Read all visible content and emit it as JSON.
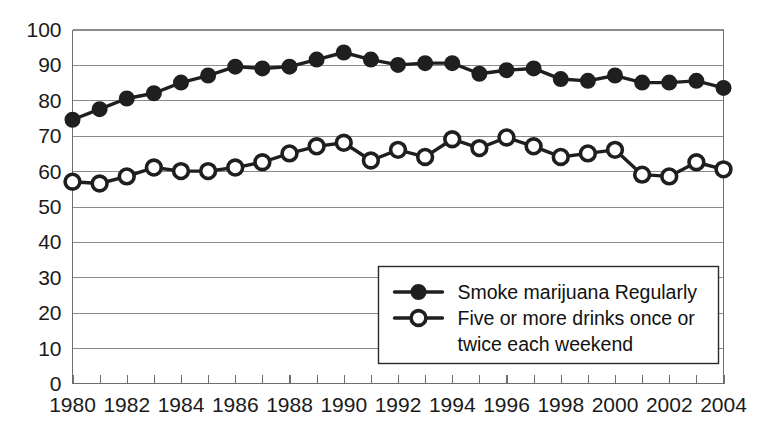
{
  "chart_data": {
    "type": "line",
    "title": "",
    "subtitle": "",
    "xlabel": "",
    "ylabel": "",
    "xlim": [
      1980,
      2004
    ],
    "ylim": [
      0,
      100
    ],
    "y_ticks": [
      0,
      10,
      20,
      30,
      40,
      50,
      60,
      70,
      80,
      90,
      100
    ],
    "x_ticks": [
      1980,
      1982,
      1984,
      1986,
      1988,
      1990,
      1992,
      1994,
      1996,
      1998,
      2000,
      2002,
      2004
    ],
    "x_tick_labels": [
      "1980",
      "1982",
      "1984",
      "1986",
      "1988",
      "1990",
      "1992",
      "1994",
      "1996",
      "1998",
      "2000",
      "2002",
      "2004"
    ],
    "y_tick_labels": [
      "0",
      "10",
      "20",
      "30",
      "40",
      "50",
      "60",
      "70",
      "80",
      "90",
      "100"
    ],
    "grid": true,
    "grid_axis": "y",
    "legend_position": "lower-right",
    "x": [
      1980,
      1981,
      1982,
      1983,
      1984,
      1985,
      1986,
      1987,
      1988,
      1989,
      1990,
      1991,
      1992,
      1993,
      1994,
      1995,
      1996,
      1997,
      1998,
      1999,
      2000,
      2001,
      2002,
      2003,
      2004
    ],
    "series": [
      {
        "name": "Smoke marijuana Regularly",
        "marker": "filled-circle",
        "color": "#1f1f1f",
        "values": [
          74.5,
          77.5,
          80.5,
          82,
          85,
          87,
          89.5,
          89,
          89.5,
          91.5,
          93.5,
          91.5,
          90,
          90.5,
          90.5,
          87.5,
          88.5,
          89,
          86,
          85.5,
          87,
          85,
          85,
          85.5,
          83.5
        ]
      },
      {
        "name": "Five or more drinks once or twice each weekend",
        "marker": "open-circle",
        "color": "#1f1f1f",
        "values": [
          57,
          56.5,
          58.5,
          61,
          60,
          60,
          61,
          62.5,
          65,
          67,
          68,
          63,
          66,
          64,
          69,
          66.5,
          69.5,
          67,
          64,
          65,
          66,
          59,
          58.5,
          62.5,
          60.5
        ]
      }
    ]
  },
  "legend": {
    "entries": [
      {
        "label": "Smoke marijuana Regularly",
        "marker": "filled-circle"
      },
      {
        "label": "Five or more drinks once or",
        "label_line2": "twice each weekend",
        "marker": "open-circle"
      }
    ]
  },
  "colors": {
    "series_ink": "#1f1f1f",
    "gridline": "#8c8c8c",
    "axis": "#6e6e6e",
    "background": "#ffffff",
    "text": "#1a1a1a"
  }
}
